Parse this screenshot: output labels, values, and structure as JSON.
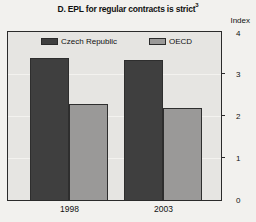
{
  "page": {
    "background": "#f2f1ee"
  },
  "chart_data": {
    "type": "bar",
    "title": "D. EPL for regular contracts is strict",
    "title_superscript": "3",
    "unit_label": "Index",
    "categories": [
      "1998",
      "2003"
    ],
    "series": [
      {
        "name": "Czech Republic",
        "color": "#3f3f3f",
        "values": [
          3.4,
          3.35
        ]
      },
      {
        "name": "OECD",
        "color": "#9a9998",
        "values": [
          2.3,
          2.2
        ]
      }
    ],
    "ylabel": "Index",
    "ylim": [
      0,
      4
    ],
    "y_ticks": [
      0,
      1,
      2,
      3,
      4
    ],
    "grid": true,
    "legend_position": "top-inside",
    "plot_background": "#e6e5e2",
    "frame_color": "#2b2b2b",
    "gridline_color": "#f3f2ef",
    "text_color": "#111111"
  }
}
